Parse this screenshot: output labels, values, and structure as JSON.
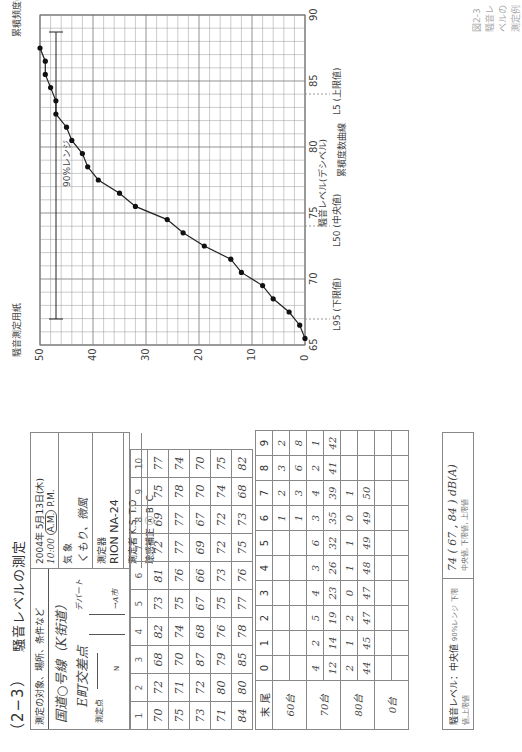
{
  "header": {
    "section_number": "（2−3）",
    "title": "騒音レベルの測定"
  },
  "info": {
    "conditions_label": "測定の対象、場所、条件など",
    "location_line1": "国道○号線（K街道）",
    "location_line2": "E町交差点",
    "map_labels": {
      "measure_point": "測定点",
      "department_store": "デパート",
      "to_city": "→A市",
      "north": "N"
    },
    "datetime": "2004年 5月13日(木)",
    "time": "10:00",
    "am": "A.M.",
    "pm": "P.M.",
    "weather_label": "気 象",
    "weather_value": "くもり、微風",
    "instrument_label": "測定器",
    "instrument_value": "RION NA-24",
    "operator_label": "測定者",
    "operator_value": "K.S. T.O",
    "weighting_label": "聴感補正",
    "weighting_options": "Ⓐ B, C"
  },
  "readings": {
    "columns": [
      "1",
      "2",
      "3",
      "4",
      "5",
      "6",
      "7",
      "8",
      "9",
      "10"
    ],
    "rows": [
      [
        "70",
        "72",
        "68",
        "82",
        "73",
        "81",
        "72",
        "69",
        "75",
        "77"
      ],
      [
        "75",
        "71",
        "70",
        "74",
        "75",
        "76",
        "77",
        "77",
        "78",
        "74"
      ],
      [
        "73",
        "72",
        "87",
        "68",
        "67",
        "66",
        "69",
        "67",
        "70",
        "70"
      ],
      [
        "71",
        "80",
        "79",
        "76",
        "75",
        "73",
        "72",
        "72",
        "74",
        "75"
      ],
      [
        "84",
        "80",
        "85",
        "78",
        "77",
        "76",
        "75",
        "73",
        "68",
        "82"
      ]
    ]
  },
  "tally": {
    "header_label": "末 尾",
    "digits": [
      "0",
      "1",
      "2",
      "3",
      "4",
      "5",
      "6",
      "7",
      "8",
      "9"
    ],
    "groups": [
      {
        "label": "60台",
        "counts": [
          "",
          "",
          "",
          "",
          "",
          "",
          "1",
          "2",
          "3",
          "2"
        ],
        "cumulative": [
          "",
          "",
          "",
          "",
          "",
          "",
          "1",
          "3",
          "6",
          "8"
        ]
      },
      {
        "label": "70台",
        "counts": [
          "4",
          "2",
          "5",
          "4",
          "3",
          "6",
          "3",
          "4",
          "2",
          "1"
        ],
        "cumulative": [
          "12",
          "14",
          "19",
          "23",
          "26",
          "32",
          "35",
          "39",
          "41",
          "42"
        ]
      },
      {
        "label": "80台",
        "counts": [
          "2",
          "1",
          "2",
          "0",
          "1",
          "1",
          "0",
          "1",
          "",
          ""
        ],
        "cumulative": [
          "44",
          "45",
          "47",
          "47",
          "48",
          "49",
          "49",
          "50",
          "",
          ""
        ]
      },
      {
        "label": "0台",
        "counts": [
          "",
          "",
          "",
          "",
          "",
          "",
          "",
          "",
          "",
          ""
        ],
        "cumulative": [
          "",
          "",
          "",
          "",
          "",
          "",
          "",
          "",
          "",
          ""
        ]
      }
    ]
  },
  "result": {
    "label": "騒音レベル：中央値",
    "range_label": "90%レンジ 下限値,上限値",
    "value": "74 ( 67 , 84 ) dB(A)",
    "sub_label": "中央値, 下限値, 上限値"
  },
  "chart_data": {
    "type": "line",
    "title": "騒音測定用紙",
    "subtitle": "累積度数曲線",
    "xlabel": "騒音レベル(デシベル)",
    "ylabel": "累積頻度（度数）",
    "y2label": "累積頻度(%)",
    "xlim": [
      65,
      90
    ],
    "ylim": [
      0,
      50
    ],
    "x_ticks": [
      65,
      70,
      75,
      80,
      85,
      90
    ],
    "y_ticks": [
      0,
      10,
      20,
      30,
      40,
      50
    ],
    "y2_ticks": [
      0,
      5,
      50,
      95,
      100
    ],
    "grid": true,
    "series": [
      {
        "name": "累積度数",
        "x": [
          65.5,
          66.5,
          67.5,
          68.5,
          69.5,
          70.5,
          71.5,
          72.5,
          73.5,
          74.5,
          75.5,
          76.5,
          77.5,
          78.5,
          79.5,
          80.5,
          81.5,
          82.5,
          83.5,
          84.5,
          85.5,
          86.5,
          87.5
        ],
        "values": [
          0,
          1,
          3,
          6,
          8,
          12,
          14,
          19,
          23,
          26,
          32,
          35,
          39,
          41,
          42,
          44,
          45,
          47,
          47,
          48,
          49,
          49,
          50
        ]
      }
    ],
    "annotations": [
      {
        "label": "L95 (下限値)",
        "x": 67
      },
      {
        "label": "L50 (中央値)",
        "x": 74
      },
      {
        "label": "L5 (上限値)",
        "x": 84
      },
      {
        "label": "90%レンジ",
        "from": 67,
        "to": 84
      }
    ]
  },
  "caption": "図2-3 騒音レベルの測定例"
}
